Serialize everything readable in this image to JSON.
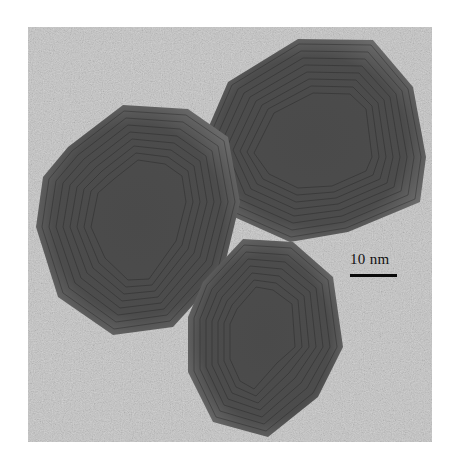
{
  "figure": {
    "type": "TEM micrograph",
    "particles": [
      {
        "name": "top-right-particle",
        "shape": "faceted hexagonal"
      },
      {
        "name": "left-particle",
        "shape": "rounded polygonal"
      },
      {
        "name": "bottom-particle",
        "shape": "elongated faceted"
      }
    ],
    "scale_bar": {
      "label": "10 nm",
      "color": "#0a0a0a"
    },
    "colors": {
      "background": "#c4c4c4",
      "particle_dark": "#3a3a3a",
      "page": "#ffffff"
    }
  }
}
